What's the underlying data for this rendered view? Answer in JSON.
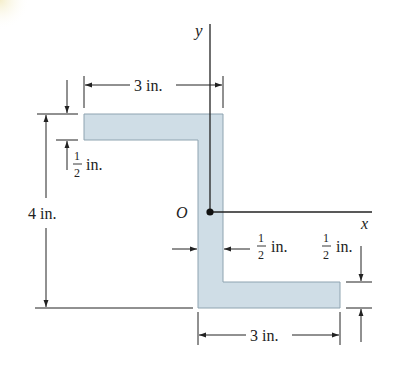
{
  "figure": {
    "type": "Z-section cross-section",
    "fill_color": "#cfdde6",
    "edge_color": "#8ea3b0",
    "line_color": "#222222",
    "axes": {
      "y_label": "y",
      "x_label": "x",
      "origin_label": "O"
    },
    "dimensions": {
      "top_flange_width": "3 in.",
      "bottom_flange_width": "3 in.",
      "overall_height": "4 in.",
      "top_flange_thickness_num": "1",
      "top_flange_thickness_den": "2",
      "top_flange_thickness_unit": "in.",
      "web_thickness_num": "1",
      "web_thickness_den": "2",
      "web_thickness_unit": "in.",
      "bottom_flange_thickness_num": "1",
      "bottom_flange_thickness_den": "2",
      "bottom_flange_thickness_unit": "in."
    }
  }
}
